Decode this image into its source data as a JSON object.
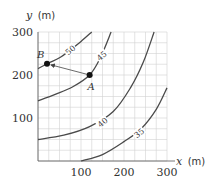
{
  "chart_data": {
    "type": "line",
    "subtype": "contour",
    "title": "",
    "xlabel": "x (m)",
    "ylabel": "y (m)",
    "xlim": [
      0,
      300
    ],
    "ylim": [
      0,
      300
    ],
    "x_ticks": [
      100,
      200,
      300
    ],
    "y_ticks": [
      100,
      200,
      300
    ],
    "x_tick_labels": [
      "100",
      "200",
      "300"
    ],
    "y_tick_labels": [
      "100",
      "200",
      "300"
    ],
    "grid": true,
    "grid_spacing": 25,
    "legend": null,
    "series": [
      {
        "name": "50",
        "level": 50,
        "points": [
          [
            0,
            215
          ],
          [
            25,
            228
          ],
          [
            50,
            240
          ],
          [
            75,
            258
          ],
          [
            100,
            278
          ],
          [
            125,
            300
          ]
        ]
      },
      {
        "name": "45",
        "level": 45,
        "points": [
          [
            0,
            140
          ],
          [
            40,
            155
          ],
          [
            80,
            172
          ],
          [
            120,
            200
          ],
          [
            145,
            240
          ],
          [
            170,
            300
          ]
        ]
      },
      {
        "name": "40",
        "level": 40,
        "points": [
          [
            0,
            50
          ],
          [
            60,
            60
          ],
          [
            120,
            80
          ],
          [
            175,
            115
          ],
          [
            215,
            170
          ],
          [
            245,
            230
          ],
          [
            270,
            300
          ]
        ]
      },
      {
        "name": "35",
        "level": 35,
        "points": [
          [
            100,
            0
          ],
          [
            150,
            15
          ],
          [
            200,
            45
          ],
          [
            240,
            75
          ],
          [
            275,
            120
          ],
          [
            300,
            170
          ]
        ]
      }
    ],
    "contour_labels": [
      {
        "text": "50",
        "x": 75,
        "y": 258
      },
      {
        "text": "45",
        "x": 148,
        "y": 245
      },
      {
        "text": "40",
        "x": 150,
        "y": 90
      },
      {
        "text": "35",
        "x": 235,
        "y": 65
      }
    ],
    "points": [
      {
        "label": "B",
        "x": 21,
        "y": 226
      },
      {
        "label": "A",
        "x": 120,
        "y": 200
      }
    ],
    "annotations": [
      {
        "type": "arrow",
        "from": "A",
        "to": "B"
      }
    ]
  },
  "labels": {
    "y_axis_var": "y",
    "y_axis_unit": "(m)",
    "x_axis_var": "x",
    "x_axis_unit": "(m)",
    "y_tick_300": "300",
    "y_tick_200": "200",
    "y_tick_100": "100",
    "x_tick_100": "100",
    "x_tick_200": "200",
    "x_tick_300": "300",
    "point_a": "A",
    "point_b": "B",
    "contour_50": "50",
    "contour_45": "45",
    "contour_40": "40",
    "contour_35": "35"
  },
  "colors": {
    "grid": "#cfcfcf",
    "axis": "#444444",
    "contour": "#444444",
    "point": "#111111",
    "text": "#333333"
  }
}
